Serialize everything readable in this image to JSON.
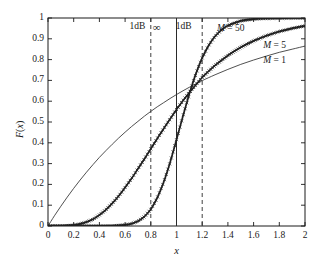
{
  "chart_data": {
    "type": "line",
    "title": "",
    "xlabel": "x",
    "ylabel": "F(x)",
    "xlim": [
      0,
      2
    ],
    "ylim": [
      0,
      1
    ],
    "xticks": [
      "0",
      "0.2",
      "0.4",
      "0.6",
      "0.8",
      "1",
      "1.2",
      "1.4",
      "1.6",
      "1.8",
      "2"
    ],
    "xtick_values": [
      0,
      0.2,
      0.4,
      0.6,
      0.8,
      1.0,
      1.2,
      1.4,
      1.6,
      1.8,
      2.0
    ],
    "yticks": [
      "0",
      "0.1",
      "0.2",
      "0.3",
      "0.4",
      "0.5",
      "0.6",
      "0.7",
      "0.8",
      "0.9",
      "1"
    ],
    "ytick_values": [
      0,
      0.1,
      0.2,
      0.3,
      0.4,
      0.5,
      0.6,
      0.7,
      0.8,
      0.9,
      1.0
    ],
    "grid": false,
    "legend_position": "inline-curve-labels",
    "series": [
      {
        "name": "M = 1",
        "style": "thin-solid-line",
        "markers": "none",
        "x": [
          0,
          0.05,
          0.1,
          0.15,
          0.2,
          0.25,
          0.3,
          0.35,
          0.4,
          0.45,
          0.5,
          0.55,
          0.6,
          0.65,
          0.7,
          0.75,
          0.8,
          0.85,
          0.9,
          0.95,
          1.0,
          1.05,
          1.1,
          1.15,
          1.2,
          1.3,
          1.4,
          1.5,
          1.6,
          1.7,
          1.8,
          1.9,
          2.0
        ],
        "values": [
          0,
          0.049,
          0.095,
          0.139,
          0.181,
          0.221,
          0.259,
          0.295,
          0.33,
          0.362,
          0.393,
          0.423,
          0.451,
          0.478,
          0.503,
          0.528,
          0.551,
          0.573,
          0.593,
          0.613,
          0.632,
          0.65,
          0.667,
          0.683,
          0.699,
          0.727,
          0.753,
          0.777,
          0.798,
          0.817,
          0.835,
          0.85,
          0.865
        ]
      },
      {
        "name": "M = 5",
        "style": "thick-line-with-markers",
        "markers": "cross",
        "x": [
          0,
          0.1,
          0.2,
          0.25,
          0.3,
          0.35,
          0.4,
          0.45,
          0.5,
          0.55,
          0.6,
          0.65,
          0.7,
          0.75,
          0.8,
          0.85,
          0.9,
          0.95,
          1.0,
          1.05,
          1.1,
          1.15,
          1.2,
          1.25,
          1.3,
          1.4,
          1.5,
          1.6,
          1.7,
          1.8,
          1.9,
          2.0
        ],
        "values": [
          0,
          0.0001,
          0.004,
          0.01,
          0.019,
          0.032,
          0.053,
          0.078,
          0.109,
          0.144,
          0.185,
          0.228,
          0.275,
          0.322,
          0.371,
          0.42,
          0.468,
          0.514,
          0.56,
          0.602,
          0.642,
          0.678,
          0.714,
          0.744,
          0.772,
          0.82,
          0.859,
          0.89,
          0.915,
          0.935,
          0.95,
          0.962
        ]
      },
      {
        "name": "M = 50",
        "style": "thick-line-with-markers",
        "markers": "cross",
        "x": [
          0,
          0.2,
          0.4,
          0.5,
          0.6,
          0.65,
          0.7,
          0.75,
          0.8,
          0.85,
          0.9,
          0.95,
          1.0,
          1.05,
          1.1,
          1.15,
          1.2,
          1.25,
          1.3,
          1.35,
          1.4,
          1.5,
          1.6,
          1.7,
          1.8,
          1.9,
          2.0
        ],
        "values": [
          0,
          0,
          0.0002,
          0.001,
          0.005,
          0.011,
          0.023,
          0.045,
          0.08,
          0.135,
          0.21,
          0.305,
          0.415,
          0.528,
          0.635,
          0.73,
          0.808,
          0.868,
          0.912,
          0.943,
          0.964,
          0.986,
          0.995,
          0.998,
          0.999,
          1.0,
          1.0
        ]
      }
    ],
    "reference_lines": [
      {
        "name": "ref-dashed-left",
        "x": 0.8,
        "style": "dashed",
        "label": "1dB"
      },
      {
        "name": "ref-solid-center",
        "x": 1.0,
        "style": "solid",
        "label": "∞"
      },
      {
        "name": "ref-dashed-right",
        "x": 1.2,
        "style": "dashed",
        "label": "1dB"
      }
    ],
    "annotations": [
      {
        "name": "annot-1db-left",
        "text": "1dB",
        "x": 0.72,
        "y": 0.955
      },
      {
        "name": "annot-infinity",
        "text": "∞",
        "x": 0.9,
        "y": 0.955
      },
      {
        "name": "annot-1db-right",
        "text": "1dB",
        "x": 1.08,
        "y": 0.955
      },
      {
        "name": "annot-m50",
        "text": "M = 50",
        "x": 1.4,
        "y": 0.945
      },
      {
        "name": "annot-m5",
        "text": "M = 5",
        "x": 1.76,
        "y": 0.865
      },
      {
        "name": "annot-m1",
        "text": "M = 1",
        "x": 1.76,
        "y": 0.795
      }
    ],
    "colors": {
      "axis": "#1a1a1a",
      "curve_m1": "#303030",
      "curve_m5": "#202020",
      "curve_m50": "#202020",
      "reference_line": "#2a2a2a",
      "background": "#ffffff"
    }
  },
  "axis": {
    "x_label": "x",
    "y_label": "F(x)"
  },
  "labels": {
    "m50": "M = 50",
    "m5": "M = 5",
    "m1": "M = 1",
    "db_left": "1dB",
    "db_right": "1dB",
    "infinity": "∞"
  }
}
